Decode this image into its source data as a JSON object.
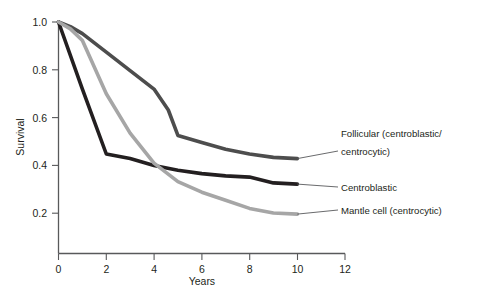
{
  "chart_data": {
    "type": "line",
    "title": "",
    "xlabel": "Years",
    "ylabel": "Survival",
    "xlim": [
      0,
      12
    ],
    "ylim": [
      0,
      1.0
    ],
    "xticks": [
      0,
      2,
      4,
      6,
      8,
      10,
      12
    ],
    "xtick_labels": [
      "0",
      "2",
      "4",
      "6",
      "8",
      "10",
      "12"
    ],
    "yticks": [
      0.2,
      0.4,
      0.6,
      0.8,
      1.0
    ],
    "ytick_labels": [
      "0.2",
      "0.4",
      "0.6",
      "0.8",
      "1.0"
    ],
    "grid": false,
    "legend_position": "right-annotations",
    "series": [
      {
        "name": "Follicular (centroblastic/centrocytic)",
        "color": "#4d4d4d",
        "x": [
          0,
          0.5,
          1,
          2,
          3,
          4,
          4.6,
          5,
          6,
          7,
          8,
          9,
          10
        ],
        "y": [
          1.0,
          0.98,
          0.95,
          0.87,
          0.79,
          0.71,
          0.62,
          0.51,
          0.48,
          0.45,
          0.43,
          0.415,
          0.41
        ]
      },
      {
        "name": "Centroblastic",
        "color": "#231f20",
        "x": [
          0,
          1,
          2,
          3,
          4,
          5,
          6,
          7,
          8,
          9,
          10
        ],
        "y": [
          1.0,
          0.71,
          0.43,
          0.41,
          0.38,
          0.36,
          0.345,
          0.335,
          0.33,
          0.305,
          0.3
        ]
      },
      {
        "name": "Mantle cell (centrocytic)",
        "color": "#a6a6a6",
        "x": [
          0,
          0.5,
          1,
          2,
          3,
          4,
          5,
          6,
          7,
          8,
          9,
          10
        ],
        "y": [
          1.0,
          0.97,
          0.92,
          0.69,
          0.52,
          0.39,
          0.31,
          0.265,
          0.23,
          0.195,
          0.175,
          0.17
        ]
      }
    ],
    "annotations": [
      {
        "name": "follicular-annotation",
        "lines": [
          "Follicular (centroblastic/",
          "centrocytic)"
        ],
        "color": "#4d4d4d"
      },
      {
        "name": "centroblastic-annotation",
        "lines": [
          "Centroblastic"
        ],
        "color": "#231f20"
      },
      {
        "name": "mantle-cell-annotation",
        "lines": [
          "Mantle cell (centrocytic)"
        ],
        "color": "#a6a6a6"
      }
    ]
  },
  "axes": {
    "x_label": "Years",
    "y_label": "Survival",
    "x_ticks": [
      "0",
      "2",
      "4",
      "6",
      "8",
      "10",
      "12"
    ],
    "y_ticks": [
      "1.0",
      "0.8",
      "0.6",
      "0.4",
      "0.2"
    ]
  },
  "legend": {
    "follicular_line1": "Follicular (centroblastic/",
    "follicular_line2": "centrocytic)",
    "centroblastic": "Centroblastic",
    "mantle": "Mantle cell (centrocytic)"
  },
  "colors": {
    "follicular": "#4d4d4d",
    "centroblastic": "#231f20",
    "mantle": "#a6a6a6",
    "axis": "#58595b",
    "background": "#ffffff"
  }
}
